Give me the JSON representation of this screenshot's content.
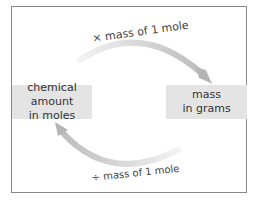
{
  "diagram": {
    "nodes": [
      {
        "id": "moles",
        "lines": [
          "chemical amount",
          "in moles"
        ]
      },
      {
        "id": "grams",
        "lines": [
          "mass",
          "in grams"
        ]
      }
    ],
    "edges": [
      {
        "from": "moles",
        "to": "grams",
        "label": "× mass of 1 mole"
      },
      {
        "from": "grams",
        "to": "moles",
        "label": "÷ mass of 1 mole"
      }
    ],
    "colors": {
      "box_fill": "#e4e4e4",
      "arrow": "#cfcfcf",
      "border": "#888888",
      "text": "#333333"
    }
  }
}
